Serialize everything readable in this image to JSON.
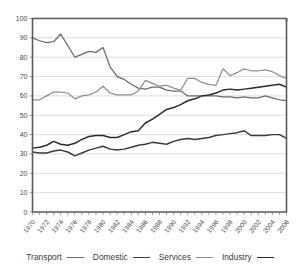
{
  "chart_data": {
    "type": "line",
    "title": "",
    "subtitle": "",
    "xlabel": "",
    "ylabel": "",
    "xlim": [
      1970,
      2006
    ],
    "ylim": [
      0,
      100
    ],
    "grid": true,
    "legend_position": "bottom",
    "x": [
      1970,
      1971,
      1972,
      1973,
      1974,
      1975,
      1976,
      1977,
      1978,
      1979,
      1980,
      1981,
      1982,
      1983,
      1984,
      1985,
      1986,
      1987,
      1988,
      1989,
      1990,
      1991,
      1992,
      1993,
      1994,
      1995,
      1996,
      1997,
      1998,
      1999,
      2000,
      2001,
      2002,
      2003,
      2004,
      2005,
      2006
    ],
    "xtick_labels": [
      "1970",
      "1972",
      "1974",
      "1976",
      "1978",
      "1980",
      "1982",
      "1984",
      "1986",
      "1988",
      "1990",
      "1992",
      "1994",
      "1996",
      "1998",
      "2000",
      "2002",
      "2004",
      "2006"
    ],
    "ytick_labels": [
      "0",
      "10",
      "20",
      "30",
      "40",
      "50",
      "60",
      "70",
      "80",
      "90",
      "100"
    ],
    "series": [
      {
        "name": "Transport",
        "color": "#6b6b6b",
        "width": 1.25,
        "values": [
          90,
          88.5,
          87.5,
          88,
          92,
          86,
          80,
          81.5,
          83,
          82.5,
          85,
          75,
          70,
          68.5,
          66,
          64,
          63.5,
          64.5,
          64.5,
          63,
          62.5,
          62.5,
          60,
          60,
          60,
          60,
          60,
          59.5,
          59.5,
          59,
          59.5,
          59,
          59,
          60,
          59,
          58,
          57.5
        ]
      },
      {
        "name": "Domestic",
        "color": "#3a3a3a",
        "width": 1.45,
        "values": [
          31,
          30.5,
          30.5,
          31.5,
          32,
          31,
          29,
          30.5,
          32,
          33,
          34,
          32.5,
          32,
          32.5,
          33.5,
          34.5,
          35,
          36,
          35.5,
          35,
          36.5,
          37.5,
          38,
          37.5,
          38,
          38.5,
          39.5,
          40,
          40.5,
          41,
          42,
          39.5,
          39.5,
          39.5,
          40,
          40,
          38
        ]
      },
      {
        "name": "Services",
        "color": "#8e8e8e",
        "width": 1.25,
        "values": [
          58,
          58,
          60,
          62,
          62,
          61.5,
          58.5,
          60,
          60.5,
          62,
          65,
          61.5,
          60.5,
          60.5,
          60.5,
          62.5,
          68,
          66.5,
          65,
          65.5,
          64,
          63,
          69,
          69,
          67,
          66,
          65.5,
          74,
          70.5,
          72,
          74,
          73,
          73,
          73.5,
          72.5,
          70.5,
          69
        ]
      },
      {
        "name": "Industry",
        "color": "#2b2b2b",
        "width": 1.45,
        "values": [
          33,
          33.5,
          34.5,
          36.5,
          35,
          34.5,
          35.5,
          37.5,
          39,
          39.5,
          39.5,
          38.5,
          38.5,
          40,
          41.5,
          42,
          46,
          48,
          50.5,
          53,
          54,
          55.5,
          57.5,
          58.5,
          60,
          60.5,
          61.5,
          63,
          63.5,
          63,
          63.5,
          64,
          64.5,
          65,
          65.5,
          66,
          64.5
        ]
      }
    ]
  },
  "legend": {
    "items": [
      {
        "label": "Transport",
        "color": "#6b6b6b",
        "thickness": 1.5
      },
      {
        "label": "Domestic",
        "color": "#3a3a3a",
        "thickness": 1.8
      },
      {
        "label": "Services",
        "color": "#8e8e8e",
        "thickness": 1.5
      },
      {
        "label": "Industry",
        "color": "#2b2b2b",
        "thickness": 1.8
      }
    ]
  }
}
